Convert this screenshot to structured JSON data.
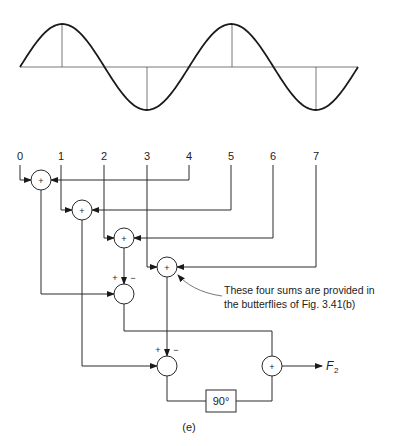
{
  "waveform": {
    "baseline_y": 67,
    "x_start": 20,
    "x_end": 358,
    "amplitude": 43,
    "cycles": 2,
    "sample_lines_x": [
      62,
      147,
      232,
      316
    ]
  },
  "inputs": {
    "labels": [
      "0",
      "1",
      "2",
      "3",
      "4",
      "5",
      "6",
      "7"
    ],
    "x": [
      20,
      61,
      104,
      147,
      189,
      231,
      273,
      316
    ],
    "label_y": 160
  },
  "adders": [
    {
      "id": "adder-0",
      "symbol": "+",
      "cx": 41,
      "cy": 180
    },
    {
      "id": "adder-1",
      "symbol": "+",
      "cx": 82,
      "cy": 210
    },
    {
      "id": "adder-2",
      "symbol": "+",
      "cx": 124,
      "cy": 238
    },
    {
      "id": "adder-3",
      "symbol": "+",
      "cx": 167,
      "cy": 267
    }
  ],
  "subtractors": [
    {
      "id": "subtractor-mid",
      "plus": "+",
      "minus": "−",
      "cx": 124,
      "cy": 294
    },
    {
      "id": "subtractor-bottom",
      "plus": "+",
      "minus": "−",
      "cx": 167,
      "cy": 366
    }
  ],
  "final_adder": {
    "symbol": "+",
    "cx": 272,
    "cy": 366
  },
  "phase_box": {
    "label": "90°"
  },
  "output": {
    "label": "F",
    "subscript": "2"
  },
  "annotation": {
    "line1": "These four sums are provided in",
    "line2": "the butterflies of Fig. 3.41(b)"
  },
  "caption": "(e)"
}
